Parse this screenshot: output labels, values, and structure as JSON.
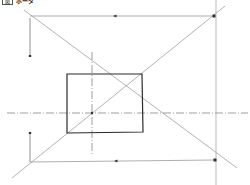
{
  "header": {
    "box_label": "図",
    "title": "ボーダ",
    "note": "Header text is illegible at this resolution; the box label and title strings are best guesses."
  },
  "diagram": {
    "type": "perspective construction drawing",
    "colors": {
      "construction_line": "#9a9a9a",
      "rectangle": "#2b2b2b",
      "center_line": "#777777",
      "marker": "#333333"
    },
    "rectangle": {
      "x1": 67,
      "y1": 74,
      "x2": 142,
      "y2": 133
    },
    "center_point": {
      "x": 92,
      "y": 113
    },
    "corner_points": [
      {
        "name": "top-right",
        "x": 214,
        "y": 16
      },
      {
        "name": "bottom-right",
        "x": 215,
        "y": 160
      }
    ],
    "arrow_markers": [
      {
        "name": "top-arrow",
        "x": 115,
        "y": 16
      },
      {
        "name": "bottom-arrow",
        "x": 116,
        "y": 161
      }
    ]
  }
}
